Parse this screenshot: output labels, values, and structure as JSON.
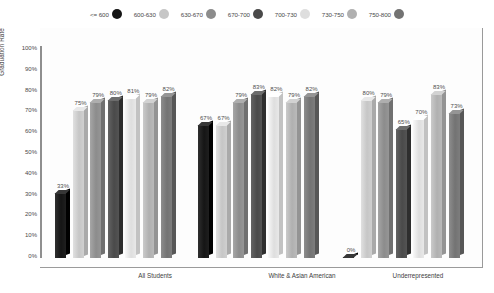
{
  "chart_data": {
    "type": "bar",
    "title": "",
    "xlabel": "",
    "ylabel": "Graduation Rate",
    "ylim": [
      0,
      100
    ],
    "grid": false,
    "legend_position": "top-center",
    "categories": [
      "All Students",
      "White & Asian American",
      "Underrepresented"
    ],
    "series": [
      {
        "name": "<= 600",
        "color": "#151515",
        "values": [
          33,
          67,
          0
        ]
      },
      {
        "name": "600-630",
        "color": "#c6c6c6",
        "values": [
          75,
          67,
          80
        ]
      },
      {
        "name": "630-670",
        "color": "#8c8c8c",
        "values": [
          79,
          79,
          79
        ]
      },
      {
        "name": "670-700",
        "color": "#4a4a4a",
        "values": [
          80,
          83,
          65
        ]
      },
      {
        "name": "700-730",
        "color": "#dedede",
        "values": [
          81,
          82,
          70
        ]
      },
      {
        "name": "730-750",
        "color": "#b0b0b0",
        "values": [
          79,
          79,
          83
        ]
      },
      {
        "name": "750-800",
        "color": "#737373",
        "values": [
          82,
          82,
          73
        ]
      }
    ],
    "value_labels": [
      [
        "33%",
        "75%",
        "79%",
        "80%",
        "81%",
        "79%",
        "82%"
      ],
      [
        "67%",
        "67%",
        "79%",
        "83%",
        "82%",
        "79%",
        "82%"
      ],
      [
        "0%",
        "80%",
        "79%",
        "65%",
        "70%",
        "83%",
        "73%"
      ]
    ],
    "y_ticks": [
      "100%",
      "90%",
      "80%",
      "70%",
      "60%",
      "50%",
      "40%",
      "30%",
      "20%",
      "10%",
      "0%"
    ]
  },
  "legend": {
    "items": [
      {
        "label": "<= 600",
        "swatch": "legend-swatch-0"
      },
      {
        "label": "600-630",
        "swatch": "legend-swatch-1"
      },
      {
        "label": "630-670",
        "swatch": "legend-swatch-2"
      },
      {
        "label": "670-700",
        "swatch": "legend-swatch-3"
      },
      {
        "label": "700-730",
        "swatch": "legend-swatch-4"
      },
      {
        "label": "730-750",
        "swatch": "legend-swatch-5"
      },
      {
        "label": "750-800",
        "swatch": "legend-swatch-6"
      }
    ]
  },
  "axes": {
    "y_title": "Graduation Rate"
  },
  "caption": ""
}
